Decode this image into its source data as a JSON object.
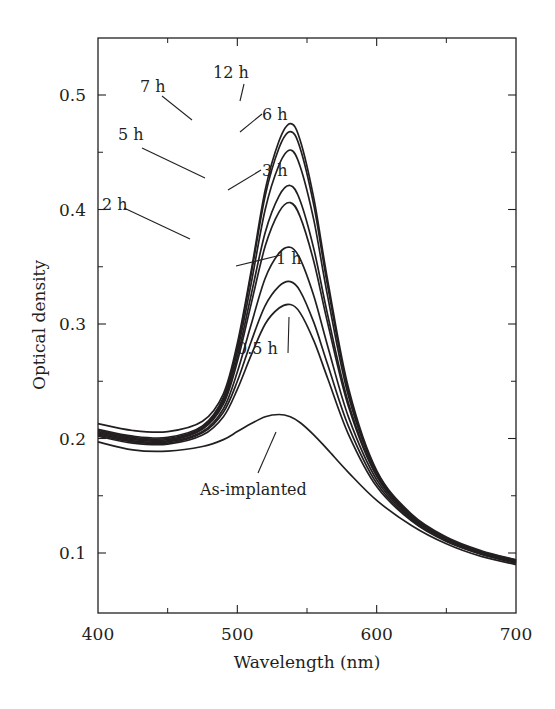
{
  "chart_data": {
    "type": "line",
    "title": "",
    "xlabel": "Wavelength (nm)",
    "ylabel": "Optical density",
    "xlim": [
      400,
      700
    ],
    "ylim": [
      0.05,
      0.55
    ],
    "xticks": [
      400,
      500,
      600,
      700
    ],
    "xtick_labels": [
      "400",
      "500",
      "600",
      "700"
    ],
    "xminor": [
      450,
      550,
      650
    ],
    "yticks": [
      0.1,
      0.2,
      0.3,
      0.4,
      0.5
    ],
    "ytick_labels": [
      "0.1",
      "0.2",
      "0.3",
      "0.4",
      "0.5"
    ],
    "yminor": [
      0.15,
      0.25,
      0.35,
      0.45
    ],
    "grid": false,
    "legend": "inline annotations with leader lines",
    "x": [
      400,
      425,
      450,
      475,
      490,
      500,
      510,
      520,
      530,
      538,
      545,
      555,
      565,
      580,
      600,
      625,
      650,
      675,
      700
    ],
    "series": [
      {
        "name": "As-implanted",
        "values": [
          0.197,
          0.19,
          0.189,
          0.193,
          0.199,
          0.206,
          0.213,
          0.219,
          0.221,
          0.219,
          0.214,
          0.203,
          0.19,
          0.17,
          0.146,
          0.124,
          0.108,
          0.097,
          0.09
        ]
      },
      {
        "name": "0.5 h",
        "values": [
          0.202,
          0.196,
          0.195,
          0.203,
          0.219,
          0.243,
          0.273,
          0.3,
          0.314,
          0.317,
          0.31,
          0.285,
          0.252,
          0.203,
          0.158,
          0.128,
          0.11,
          0.099,
          0.091
        ]
      },
      {
        "name": "1 h",
        "values": [
          0.203,
          0.197,
          0.196,
          0.205,
          0.223,
          0.25,
          0.285,
          0.316,
          0.333,
          0.337,
          0.329,
          0.301,
          0.264,
          0.21,
          0.161,
          0.129,
          0.111,
          0.099,
          0.092
        ]
      },
      {
        "name": "2 h",
        "values": [
          0.204,
          0.198,
          0.197,
          0.206,
          0.226,
          0.258,
          0.3,
          0.34,
          0.362,
          0.367,
          0.357,
          0.324,
          0.28,
          0.218,
          0.164,
          0.13,
          0.111,
          0.1,
          0.092
        ]
      },
      {
        "name": "3 h",
        "values": [
          0.205,
          0.199,
          0.198,
          0.208,
          0.23,
          0.267,
          0.318,
          0.368,
          0.398,
          0.406,
          0.394,
          0.354,
          0.3,
          0.227,
          0.167,
          0.131,
          0.112,
          0.1,
          0.093
        ]
      },
      {
        "name": "5 h",
        "values": [
          0.206,
          0.2,
          0.199,
          0.209,
          0.232,
          0.271,
          0.326,
          0.38,
          0.412,
          0.421,
          0.408,
          0.365,
          0.307,
          0.23,
          0.168,
          0.132,
          0.112,
          0.1,
          0.093
        ]
      },
      {
        "name": "6 h",
        "values": [
          0.207,
          0.201,
          0.2,
          0.21,
          0.234,
          0.276,
          0.336,
          0.4,
          0.439,
          0.452,
          0.438,
          0.39,
          0.323,
          0.236,
          0.17,
          0.132,
          0.113,
          0.101,
          0.093
        ]
      },
      {
        "name": "7 h",
        "values": [
          0.208,
          0.202,
          0.201,
          0.211,
          0.236,
          0.28,
          0.344,
          0.412,
          0.454,
          0.468,
          0.454,
          0.403,
          0.332,
          0.24,
          0.171,
          0.133,
          0.113,
          0.101,
          0.094
        ]
      },
      {
        "name": "12 h",
        "values": [
          0.213,
          0.207,
          0.206,
          0.215,
          0.239,
          0.283,
          0.347,
          0.417,
          0.46,
          0.475,
          0.461,
          0.409,
          0.337,
          0.243,
          0.172,
          0.134,
          0.114,
          0.102,
          0.094
        ]
      }
    ],
    "annotations": [
      {
        "text": "12 h",
        "label_x": 213,
        "label_y": 78,
        "line": [
          [
            244,
            84
          ],
          [
            240,
            101
          ]
        ]
      },
      {
        "text": "7 h",
        "label_x": 140,
        "label_y": 92,
        "line": [
          [
            162,
            96
          ],
          [
            192,
            120
          ]
        ]
      },
      {
        "text": "6 h",
        "label_x": 262,
        "label_y": 120,
        "line": [
          [
            262,
            114
          ],
          [
            240,
            132
          ]
        ]
      },
      {
        "text": "5 h",
        "label_x": 118,
        "label_y": 140,
        "line": [
          [
            142,
            148
          ],
          [
            205,
            178
          ]
        ]
      },
      {
        "text": "3 h",
        "label_x": 262,
        "label_y": 176,
        "line": [
          [
            261,
            170
          ],
          [
            228,
            190
          ]
        ]
      },
      {
        "text": "2 h",
        "label_x": 102,
        "label_y": 210,
        "line": [
          [
            124,
            208
          ],
          [
            190,
            239
          ]
        ]
      },
      {
        "text": "1 h",
        "label_x": 276,
        "label_y": 264,
        "line": [
          [
            281,
            255
          ],
          [
            236,
            266
          ]
        ]
      },
      {
        "text": "0.5 h",
        "label_x": 237,
        "label_y": 354,
        "line": [
          [
            289,
            317
          ],
          [
            288,
            353
          ]
        ]
      },
      {
        "text": "As-implanted",
        "label_x": 200,
        "label_y": 495,
        "line": [
          [
            276,
            432
          ],
          [
            258,
            473
          ]
        ]
      }
    ],
    "line_color": "#231f20"
  }
}
